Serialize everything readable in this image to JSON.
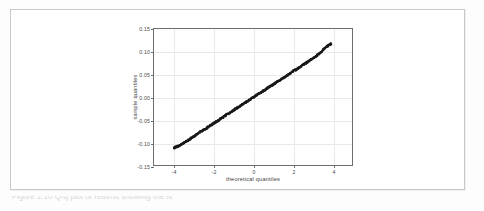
{
  "page": {
    "background_color": "#fdfdfd",
    "card_border_color": "#c9c9c9",
    "caption_partial_text": "Figure 2.10  Q-q plot of  returns showing the fit"
  },
  "figure": {
    "axis_color": "#6d6d6d",
    "grid_color": "#e9e9e9",
    "marker_color": "#1a1a1a"
  },
  "chart_data": {
    "type": "scatter",
    "title": "",
    "subtitle": "",
    "xlabel": "theoretical quantiles",
    "ylabel": "sample quantiles",
    "xlim": [
      -5.0,
      5.0
    ],
    "ylim": [
      -0.15,
      0.15
    ],
    "xticks": [
      -4,
      -2,
      0,
      2,
      4
    ],
    "xtick_labels": [
      "-4",
      "-2",
      "0",
      "2",
      "4"
    ],
    "yticks": [
      -0.15,
      -0.1,
      -0.05,
      0.0,
      0.05,
      0.1,
      0.15
    ],
    "ytick_labels": [
      "-0.15",
      "-0.10",
      "-0.05",
      "0.00",
      "0.05",
      "0.10",
      "0.15"
    ],
    "grid": true,
    "legend": "none",
    "series": [
      {
        "name": "sample vs theoretical quantiles",
        "marker": "point",
        "color": "#1a1a1a",
        "x": [
          -4.0,
          -3.8,
          -3.6,
          -3.4,
          -3.2,
          -3.0,
          -2.8,
          -2.6,
          -2.4,
          -2.2,
          -2.0,
          -1.8,
          -1.6,
          -1.4,
          -1.2,
          -1.0,
          -0.8,
          -0.6,
          -0.4,
          -0.2,
          0.0,
          0.2,
          0.4,
          0.6,
          0.8,
          1.0,
          1.2,
          1.4,
          1.6,
          1.8,
          2.0,
          2.2,
          2.4,
          2.6,
          2.8,
          3.0,
          3.2,
          3.4,
          3.6,
          3.8,
          3.95
        ],
        "y": [
          -0.112,
          -0.109,
          -0.1045,
          -0.099,
          -0.093,
          -0.0872,
          -0.0815,
          -0.0757,
          -0.07,
          -0.0643,
          -0.0586,
          -0.0528,
          -0.0471,
          -0.0414,
          -0.0357,
          -0.03,
          -0.0242,
          -0.0185,
          -0.0128,
          -0.0071,
          -0.0014,
          0.0043,
          0.01,
          0.0157,
          0.0215,
          0.0272,
          0.0329,
          0.0386,
          0.0443,
          0.05,
          0.0558,
          0.0615,
          0.0672,
          0.0729,
          0.0786,
          0.0843,
          0.0901,
          0.0975,
          0.107,
          0.114,
          0.118
        ]
      }
    ],
    "annotations": [
      {
        "text": "dense band of points lying close to the 45-degree reference line"
      },
      {
        "text": "slight upward kink near the upper-right tail around x = 3.4 to 4.0"
      }
    ]
  }
}
